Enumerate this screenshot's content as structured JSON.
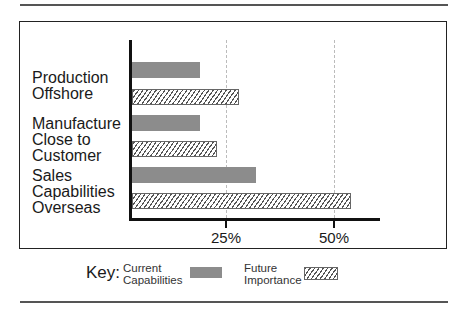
{
  "chart_data": {
    "type": "bar",
    "orientation": "horizontal",
    "title": "",
    "xlabel": "",
    "ylabel": "",
    "categories": [
      "Production Offshore",
      "Manufacture Close to Customer",
      "Sales Capabilities Overseas"
    ],
    "category_labels": [
      "Production\nOffshore",
      "Manufacture\nClose to\nCustomer",
      "Sales\nCapabilities\nOverseas"
    ],
    "series": [
      {
        "name": "Current Capabilities",
        "values": [
          19,
          19,
          32
        ],
        "color": "#8c8c8c",
        "pattern": "solid"
      },
      {
        "name": "Future Importance",
        "values": [
          28,
          23,
          54
        ],
        "color": "#555555",
        "pattern": "hatched"
      }
    ],
    "xticks": [
      "25%",
      "50%"
    ],
    "xtick_values": [
      25,
      50
    ],
    "xlim": [
      0,
      60
    ],
    "grid": "vertical dashed at ticks",
    "legend": {
      "title": "Key:",
      "position": "bottom",
      "entries": [
        "Current\nCapabilities",
        "Future\nImportance"
      ]
    }
  }
}
